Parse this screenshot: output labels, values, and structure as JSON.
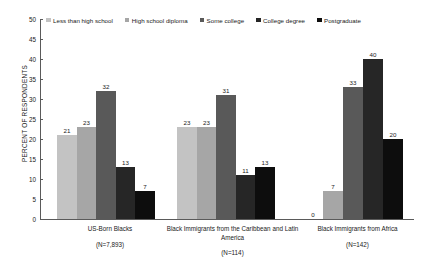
{
  "chart_data": {
    "type": "bar",
    "title": "",
    "subtitle": "",
    "xlabel": "",
    "ylabel": "PERCENT OF RESPONDENTS",
    "ylim": [
      0,
      50
    ],
    "ytick_step": 5,
    "yticks": [
      "50",
      "45",
      "40",
      "35",
      "30",
      "25",
      "20",
      "15",
      "10",
      "5",
      "0"
    ],
    "grid": false,
    "legend_position": "top",
    "categories": [
      "US-Born Blacks",
      "Black Immigrants from the Caribbean and Latin America",
      "Black Immigrants from Africa"
    ],
    "category_counts": [
      "(N=7,893)",
      "(N=114)",
      "(N=142)"
    ],
    "series": [
      {
        "name": "Less than high school",
        "color": "#c3c3c3",
        "values": [
          21,
          23,
          0
        ]
      },
      {
        "name": "High school diploma",
        "color": "#a6a6a6",
        "values": [
          23,
          23,
          7
        ]
      },
      {
        "name": "Some college",
        "color": "#595959",
        "values": [
          32,
          31,
          33
        ]
      },
      {
        "name": "College degree",
        "color": "#262626",
        "values": [
          13,
          11,
          40
        ]
      },
      {
        "name": "Postgraduate",
        "color": "#0d0d0d",
        "values": [
          7,
          13,
          20
        ]
      }
    ]
  }
}
